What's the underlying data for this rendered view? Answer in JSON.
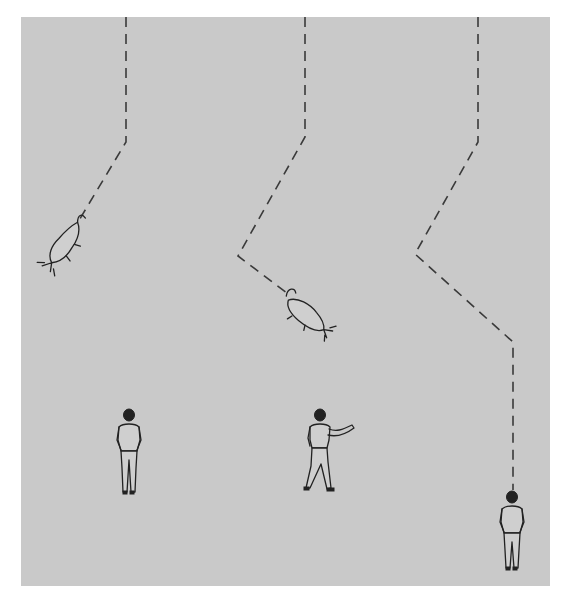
{
  "diagram": {
    "background_color": "#c9c9c9",
    "line_color": "#3a3a3a",
    "paths": [
      {
        "id": "path-1",
        "points": [
          [
            126,
            17
          ],
          [
            126,
            142
          ],
          [
            78,
            222
          ]
        ],
        "ends_at": "cat-1"
      },
      {
        "id": "path-2",
        "points": [
          [
            305,
            17
          ],
          [
            305,
            137
          ],
          [
            238,
            256
          ],
          [
            287,
            293
          ]
        ],
        "ends_at": "cat-2"
      },
      {
        "id": "path-3",
        "points": [
          [
            478,
            17
          ],
          [
            478,
            142
          ],
          [
            415,
            254
          ],
          [
            513,
            342
          ],
          [
            513,
            490
          ]
        ],
        "ends_at": "person-3"
      }
    ],
    "cats": [
      {
        "id": "cat-1",
        "x": 60,
        "y": 245,
        "pose": "falling, head down-left"
      },
      {
        "id": "cat-2",
        "x": 300,
        "y": 310,
        "pose": "falling, head down-right"
      }
    ],
    "people": [
      {
        "id": "person-1",
        "x": 129,
        "y": 450,
        "pose": "standing, hands in pockets, facing away"
      },
      {
        "id": "person-2",
        "x": 320,
        "y": 450,
        "pose": "walking, right arm extended, facing away"
      },
      {
        "id": "person-3",
        "x": 512,
        "y": 530,
        "pose": "standing, hands in pockets, facing away"
      }
    ]
  }
}
